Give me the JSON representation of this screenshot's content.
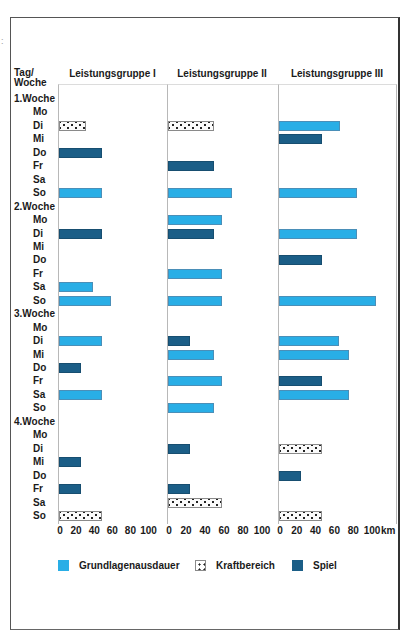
{
  "header": {
    "tag_woche": [
      "Tag/",
      "Woche"
    ],
    "groups": [
      "Leistungsgruppe I",
      "Leistungsgruppe II",
      "Leistungsgruppe III"
    ]
  },
  "rows": [
    {
      "label": "1.Woche",
      "type": "week"
    },
    {
      "label": "Mo",
      "type": "day"
    },
    {
      "label": "Di",
      "type": "day"
    },
    {
      "label": "Mi",
      "type": "day"
    },
    {
      "label": "Do",
      "type": "day"
    },
    {
      "label": "Fr",
      "type": "day"
    },
    {
      "label": "Sa",
      "type": "day"
    },
    {
      "label": "So",
      "type": "day"
    },
    {
      "label": "2.Woche",
      "type": "week"
    },
    {
      "label": "Mo",
      "type": "day"
    },
    {
      "label": "Di",
      "type": "day"
    },
    {
      "label": "Mi",
      "type": "day"
    },
    {
      "label": "Do",
      "type": "day"
    },
    {
      "label": "Fr",
      "type": "day"
    },
    {
      "label": "Sa",
      "type": "day"
    },
    {
      "label": "So",
      "type": "day"
    },
    {
      "label": "3.Woche",
      "type": "week"
    },
    {
      "label": "Mo",
      "type": "day"
    },
    {
      "label": "Di",
      "type": "day"
    },
    {
      "label": "Mi",
      "type": "day"
    },
    {
      "label": "Do",
      "type": "day"
    },
    {
      "label": "Fr",
      "type": "day"
    },
    {
      "label": "Sa",
      "type": "day"
    },
    {
      "label": "So",
      "type": "day"
    },
    {
      "label": "4.Woche",
      "type": "week"
    },
    {
      "label": "Mo",
      "type": "day"
    },
    {
      "label": "Di",
      "type": "day"
    },
    {
      "label": "Mi",
      "type": "day"
    },
    {
      "label": "Do",
      "type": "day"
    },
    {
      "label": "Fr",
      "type": "day"
    },
    {
      "label": "Sa",
      "type": "day"
    },
    {
      "label": "So",
      "type": "day"
    }
  ],
  "axis": {
    "ticks": [
      "0",
      "20",
      "40",
      "60",
      "80",
      "100"
    ],
    "unit": "km"
  },
  "legend": [
    {
      "key": "grund",
      "label": "Grundlagenausdauer",
      "color": "#29aee6"
    },
    {
      "key": "kraft",
      "label": "Kraftbereich",
      "pattern": "dotted"
    },
    {
      "key": "spiel",
      "label": "Spiel",
      "color": "#1b5e87"
    }
  ],
  "chart_data": {
    "type": "bar",
    "orientation": "horizontal",
    "title": "",
    "xlabel": "km",
    "ylabel": "Tag/Woche",
    "xlim": [
      0,
      110
    ],
    "x_ticks": [
      0,
      20,
      40,
      60,
      80,
      100
    ],
    "legend_position": "bottom",
    "grid": false,
    "categories": [
      "1.Woche Mo",
      "1.Woche Di",
      "1.Woche Mi",
      "1.Woche Do",
      "1.Woche Fr",
      "1.Woche Sa",
      "1.Woche So",
      "2.Woche Mo",
      "2.Woche Di",
      "2.Woche Mi",
      "2.Woche Do",
      "2.Woche Fr",
      "2.Woche Sa",
      "2.Woche So",
      "3.Woche Mo",
      "3.Woche Di",
      "3.Woche Mi",
      "3.Woche Do",
      "3.Woche Fr",
      "3.Woche Sa",
      "3.Woche So",
      "4.Woche Mo",
      "4.Woche Di",
      "4.Woche Mi",
      "4.Woche Do",
      "4.Woche Fr",
      "4.Woche Sa",
      "4.Woche So"
    ],
    "panels": [
      {
        "name": "Leistungsgruppe I",
        "bars": [
          {
            "week": 1,
            "day": "Di",
            "type": "Kraftbereich",
            "km": 30
          },
          {
            "week": 1,
            "day": "Do",
            "type": "Spiel",
            "km": 48
          },
          {
            "week": 1,
            "day": "So",
            "type": "Grundlagenausdauer",
            "km": 48
          },
          {
            "week": 2,
            "day": "Di",
            "type": "Spiel",
            "km": 48
          },
          {
            "week": 2,
            "day": "Sa",
            "type": "Grundlagenausdauer",
            "km": 38
          },
          {
            "week": 2,
            "day": "So",
            "type": "Grundlagenausdauer",
            "km": 57
          },
          {
            "week": 3,
            "day": "Di",
            "type": "Grundlagenausdauer",
            "km": 48
          },
          {
            "week": 3,
            "day": "Do",
            "type": "Spiel",
            "km": 24
          },
          {
            "week": 3,
            "day": "Sa",
            "type": "Grundlagenausdauer",
            "km": 48
          },
          {
            "week": 4,
            "day": "Mi",
            "type": "Spiel",
            "km": 24
          },
          {
            "week": 4,
            "day": "Fr",
            "type": "Spiel",
            "km": 24
          },
          {
            "week": 4,
            "day": "So",
            "type": "Kraftbereich",
            "km": 48
          }
        ]
      },
      {
        "name": "Leistungsgruppe II",
        "bars": [
          {
            "week": 1,
            "day": "Di",
            "type": "Kraftbereich",
            "km": 48
          },
          {
            "week": 1,
            "day": "Fr",
            "type": "Spiel",
            "km": 48
          },
          {
            "week": 1,
            "day": "So",
            "type": "Grundlagenausdauer",
            "km": 67
          },
          {
            "week": 2,
            "day": "Mo",
            "type": "Grundlagenausdauer",
            "km": 57
          },
          {
            "week": 2,
            "day": "Di",
            "type": "Spiel",
            "km": 48
          },
          {
            "week": 2,
            "day": "Fr",
            "type": "Grundlagenausdauer",
            "km": 57
          },
          {
            "week": 2,
            "day": "So",
            "type": "Grundlagenausdauer",
            "km": 57
          },
          {
            "week": 3,
            "day": "Di",
            "type": "Spiel",
            "km": 23
          },
          {
            "week": 3,
            "day": "Mi",
            "type": "Grundlagenausdauer",
            "km": 48
          },
          {
            "week": 3,
            "day": "Fr",
            "type": "Grundlagenausdauer",
            "km": 57
          },
          {
            "week": 3,
            "day": "So",
            "type": "Grundlagenausdauer",
            "km": 48
          },
          {
            "week": 4,
            "day": "Di",
            "type": "Spiel",
            "km": 23
          },
          {
            "week": 4,
            "day": "Fr",
            "type": "Spiel",
            "km": 23
          },
          {
            "week": 4,
            "day": "Sa",
            "type": "Kraftbereich",
            "km": 57
          }
        ]
      },
      {
        "name": "Leistungsgruppe III",
        "bars": [
          {
            "week": 1,
            "day": "Di",
            "type": "Grundlagenausdauer",
            "km": 65
          },
          {
            "week": 1,
            "day": "Mi",
            "type": "Spiel",
            "km": 46
          },
          {
            "week": 1,
            "day": "So",
            "type": "Grundlagenausdauer",
            "km": 83
          },
          {
            "week": 2,
            "day": "Di",
            "type": "Grundlagenausdauer",
            "km": 83
          },
          {
            "week": 2,
            "day": "Do",
            "type": "Spiel",
            "km": 46
          },
          {
            "week": 2,
            "day": "So",
            "type": "Grundlagenausdauer",
            "km": 103
          },
          {
            "week": 3,
            "day": "Di",
            "type": "Grundlagenausdauer",
            "km": 64
          },
          {
            "week": 3,
            "day": "Mi",
            "type": "Grundlagenausdauer",
            "km": 74
          },
          {
            "week": 3,
            "day": "Fr",
            "type": "Spiel",
            "km": 46
          },
          {
            "week": 3,
            "day": "Sa",
            "type": "Grundlagenausdauer",
            "km": 74
          },
          {
            "week": 4,
            "day": "Di",
            "type": "Kraftbereich",
            "km": 46
          },
          {
            "week": 4,
            "day": "Do",
            "type": "Spiel",
            "km": 23
          },
          {
            "week": 4,
            "day": "So",
            "type": "Kraftbereich",
            "km": 46
          }
        ]
      }
    ],
    "series": [
      {
        "name": "Grundlagenausdauer",
        "color": "#29aee6"
      },
      {
        "name": "Kraftbereich",
        "pattern": "dotted"
      },
      {
        "name": "Spiel",
        "color": "#1b5e87"
      }
    ]
  }
}
